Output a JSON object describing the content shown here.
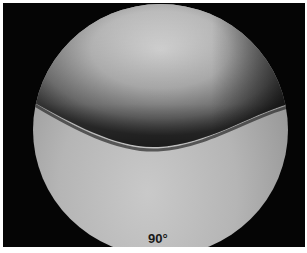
{
  "image": {
    "description": "Arthroscopic/endoscopic circular view of smooth curved tissue surfaces meeting at a fold",
    "angle_label": "90°",
    "colors": {
      "background": "#050505",
      "margin": "#ffffff",
      "tissue_light": "#d4d4d4",
      "tissue_shadow": "#3a3a3a",
      "label_text": "#1a1a1a"
    }
  }
}
